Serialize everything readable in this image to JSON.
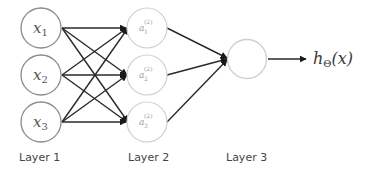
{
  "diagram": {
    "type": "neural-network",
    "layers": [
      {
        "label": "Layer 1",
        "nodes": [
          {
            "var": "x",
            "sub": "1"
          },
          {
            "var": "x",
            "sub": "2"
          },
          {
            "var": "x",
            "sub": "3"
          }
        ]
      },
      {
        "label": "Layer 2",
        "nodes": [
          {
            "var": "a",
            "sub": "1",
            "sup": "(2)"
          },
          {
            "var": "a",
            "sub": "2",
            "sup": "(2)"
          },
          {
            "var": "a",
            "sub": "3",
            "sup": "(2)"
          }
        ]
      },
      {
        "label": "Layer 3",
        "nodes": [
          {
            "var": "",
            "sub": ""
          }
        ]
      }
    ],
    "output": {
      "func": "h",
      "sub": "Θ",
      "arg": "(x)"
    },
    "colors": {
      "edge": "#2a2a2a",
      "layer1_stroke": "#8a8a8a",
      "hidden_stroke": "#cfcfcf",
      "label_text": "#444444"
    }
  }
}
